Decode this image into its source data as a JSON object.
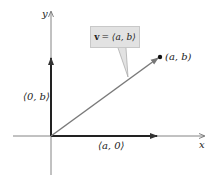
{
  "diagram": {
    "axes": {
      "x_label": "x",
      "y_label": "y"
    },
    "callout": {
      "bold": "v",
      "rest": "= ⟨a, b⟩"
    },
    "point_label": "(a, b)",
    "vertical_component_label": "⟨0, b⟩",
    "horizontal_component_label": "⟨a, 0⟩",
    "colors": {
      "axis": "#555555",
      "component": "#222222",
      "vector": "#7a7a7a",
      "callout_bg": "#e2e2e2"
    }
  }
}
